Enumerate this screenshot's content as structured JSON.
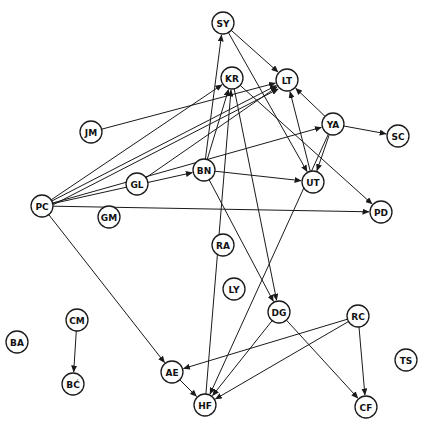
{
  "diagram": {
    "type": "directed-graph",
    "style": "hand-drawn sociogram",
    "colors": {
      "stroke": "#1a1a1a",
      "background": "#ffffff"
    },
    "node_radius": 11,
    "nodes": [
      {
        "id": "SY",
        "label": "SY",
        "x": 223,
        "y": 23
      },
      {
        "id": "KR",
        "label": "KR",
        "x": 232,
        "y": 78
      },
      {
        "id": "LT",
        "label": "LT",
        "x": 287,
        "y": 80
      },
      {
        "id": "JM",
        "label": "JM",
        "x": 91,
        "y": 132
      },
      {
        "id": "YA",
        "label": "YA",
        "x": 333,
        "y": 124
      },
      {
        "id": "SC",
        "label": "SC",
        "x": 398,
        "y": 136
      },
      {
        "id": "GL",
        "label": "GL",
        "x": 137,
        "y": 184
      },
      {
        "id": "BN",
        "label": "BN",
        "x": 204,
        "y": 170
      },
      {
        "id": "UT",
        "label": "UT",
        "x": 313,
        "y": 182
      },
      {
        "id": "PC",
        "label": "PC",
        "x": 42,
        "y": 206
      },
      {
        "id": "GM",
        "label": "GM",
        "x": 109,
        "y": 217
      },
      {
        "id": "PD",
        "label": "PD",
        "x": 381,
        "y": 212
      },
      {
        "id": "RA",
        "label": "RA",
        "x": 223,
        "y": 245
      },
      {
        "id": "LY",
        "label": "LY",
        "x": 234,
        "y": 289
      },
      {
        "id": "DG",
        "label": "DG",
        "x": 279,
        "y": 312
      },
      {
        "id": "RC",
        "label": "RC",
        "x": 358,
        "y": 316
      },
      {
        "id": "CM",
        "label": "CM",
        "x": 77,
        "y": 320
      },
      {
        "id": "BA",
        "label": "BA",
        "x": 17,
        "y": 342
      },
      {
        "id": "AE",
        "label": "AE",
        "x": 172,
        "y": 372
      },
      {
        "id": "TS",
        "label": "TS",
        "x": 406,
        "y": 360
      },
      {
        "id": "BC",
        "label": "BĆ",
        "x": 73,
        "y": 384
      },
      {
        "id": "HF",
        "label": "HF",
        "x": 205,
        "y": 405
      },
      {
        "id": "CF",
        "label": "CF",
        "x": 366,
        "y": 407
      }
    ],
    "edges": [
      {
        "from": "SY",
        "to": "LT",
        "arrow": true
      },
      {
        "from": "SY",
        "to": "UT",
        "arrow": true
      },
      {
        "from": "BN",
        "to": "SY",
        "arrow": true
      },
      {
        "from": "BN",
        "to": "KR",
        "arrow": true
      },
      {
        "from": "BN",
        "to": "UT",
        "arrow": true
      },
      {
        "from": "BN",
        "to": "DG",
        "arrow": true
      },
      {
        "from": "KR",
        "to": "PD",
        "arrow": true
      },
      {
        "from": "KR",
        "to": "DG",
        "arrow": true
      },
      {
        "from": "HF",
        "to": "KR",
        "arrow": true
      },
      {
        "from": "JM",
        "to": "LT",
        "arrow": true
      },
      {
        "from": "PC",
        "to": "LT",
        "arrow": true
      },
      {
        "from": "PC",
        "to": "LT",
        "arrow": true
      },
      {
        "from": "PC",
        "to": "KR",
        "arrow": true
      },
      {
        "from": "PC",
        "to": "BN",
        "arrow": true
      },
      {
        "from": "PC",
        "to": "YA",
        "arrow": true
      },
      {
        "from": "PC",
        "to": "PD",
        "arrow": true
      },
      {
        "from": "PC",
        "to": "AE",
        "arrow": true
      },
      {
        "from": "GL",
        "to": "LT",
        "arrow": true
      },
      {
        "from": "YA",
        "to": "LT",
        "arrow": true
      },
      {
        "from": "YA",
        "to": "SC",
        "arrow": true
      },
      {
        "from": "YA",
        "to": "UT",
        "arrow": true
      },
      {
        "from": "YA",
        "to": "HF",
        "arrow": true
      },
      {
        "from": "UT",
        "to": "LT",
        "arrow": true
      },
      {
        "from": "DG",
        "to": "HF",
        "arrow": true
      },
      {
        "from": "DG",
        "to": "CF",
        "arrow": true
      },
      {
        "from": "RC",
        "to": "AE",
        "arrow": true
      },
      {
        "from": "RC",
        "to": "HF",
        "arrow": true
      },
      {
        "from": "RC",
        "to": "CF",
        "arrow": true
      },
      {
        "from": "AE",
        "to": "HF",
        "arrow": true
      },
      {
        "from": "CM",
        "to": "BC",
        "arrow": true
      }
    ],
    "isolated_nodes": [
      "GM",
      "RA",
      "LY",
      "BA",
      "TS"
    ]
  }
}
